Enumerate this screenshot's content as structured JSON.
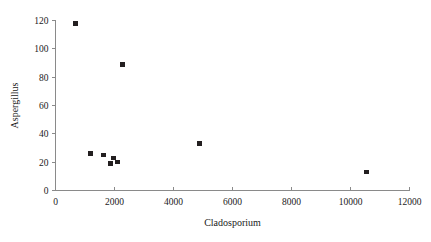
{
  "chart_data": {
    "type": "scatter",
    "title": "",
    "xlabel": "Cladosporium",
    "ylabel": "Aspergillus",
    "xlim": [
      0,
      12000
    ],
    "ylim": [
      0,
      120
    ],
    "xticks": [
      0,
      2000,
      4000,
      6000,
      8000,
      10000,
      12000
    ],
    "yticks": [
      0,
      20,
      40,
      60,
      80,
      100,
      120
    ],
    "xtick_labels": [
      "0",
      "2000",
      "4000",
      "6000",
      "8000",
      "10000",
      "12000"
    ],
    "ytick_labels": [
      "0",
      "20",
      "40",
      "60",
      "80",
      "100",
      "120"
    ],
    "grid": false,
    "legend": false,
    "marker": "square",
    "marker_color": "#231f20",
    "axis_color": "#8a8a8a",
    "series": [
      {
        "name": "Aspergillus vs Cladosporium",
        "points": [
          {
            "x": 680,
            "y": 118
          },
          {
            "x": 2270,
            "y": 89
          },
          {
            "x": 4880,
            "y": 33
          },
          {
            "x": 1190,
            "y": 26
          },
          {
            "x": 1630,
            "y": 25
          },
          {
            "x": 1970,
            "y": 23
          },
          {
            "x": 2100,
            "y": 20
          },
          {
            "x": 1870,
            "y": 19
          },
          {
            "x": 10550,
            "y": 13
          }
        ]
      }
    ]
  }
}
